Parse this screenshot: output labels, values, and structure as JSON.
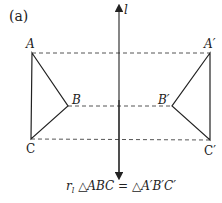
{
  "panel_label": "(a)",
  "axis": {
    "label": "l",
    "x": 119,
    "y_top": 8,
    "y_bottom": 176
  },
  "points": {
    "A": {
      "label": "A",
      "x": 32,
      "y": 53
    },
    "B": {
      "label": "B",
      "x": 68,
      "y": 106
    },
    "C": {
      "label": "C",
      "x": 31,
      "y": 139
    },
    "A2": {
      "label": "A′",
      "x": 210,
      "y": 53
    },
    "B2": {
      "label": "B′",
      "x": 172,
      "y": 106
    },
    "C2": {
      "label": "C′",
      "x": 210,
      "y": 140
    }
  },
  "caption": {
    "prefix": "r",
    "subscript": "l",
    "text": " △ABC = △A′B′C′"
  },
  "colors": {
    "stroke": "#222222",
    "dashed": "#555555",
    "background": "#ffffff"
  }
}
